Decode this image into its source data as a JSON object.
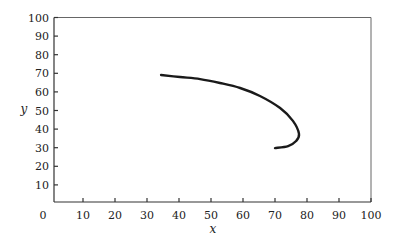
{
  "chart_data": {
    "type": "line",
    "title": "",
    "xlabel": "x",
    "ylabel": "y",
    "xlim": [
      0,
      100
    ],
    "ylim": [
      0,
      100
    ],
    "x_ticks": [
      0,
      10,
      20,
      30,
      40,
      50,
      60,
      70,
      80,
      90,
      100
    ],
    "y_ticks": [
      10,
      20,
      30,
      40,
      50,
      60,
      70,
      80,
      90,
      100
    ],
    "x_tick_labels": [
      "0",
      "10",
      "20",
      "30",
      "40",
      "50",
      "60",
      "70",
      "80",
      "90",
      "100"
    ],
    "y_tick_labels": [
      "10",
      "20",
      "30",
      "40",
      "50",
      "60",
      "70",
      "80",
      "90",
      "100"
    ],
    "grid": false,
    "legend": null,
    "series": [
      {
        "name": "trajectory",
        "color": "#1a1a1a",
        "x": [
          34.4,
          40.3,
          46.6,
          52.8,
          59.1,
          65.3,
          71.6,
          75.6,
          77.5,
          76.6,
          74.1,
          70.0
        ],
        "y": [
          69.1,
          68.0,
          66.9,
          64.8,
          62.1,
          57.8,
          51.3,
          44.4,
          37.4,
          33.6,
          30.9,
          29.8
        ]
      }
    ]
  }
}
